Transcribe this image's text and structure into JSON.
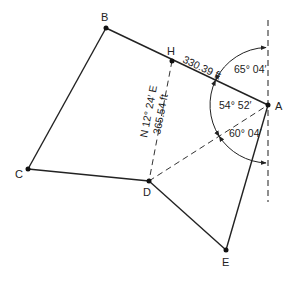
{
  "diagram": {
    "points": {
      "A": {
        "label": "A",
        "x": 268,
        "y": 105
      },
      "B": {
        "label": "B",
        "x": 106,
        "y": 28
      },
      "C": {
        "label": "C",
        "x": 28,
        "y": 169
      },
      "D": {
        "label": "D",
        "x": 149,
        "y": 181
      },
      "E": {
        "label": "E",
        "x": 226,
        "y": 250
      },
      "H": {
        "label": "H",
        "x": 172,
        "y": 61
      }
    },
    "solid_lines": [
      [
        "A",
        "B"
      ],
      [
        "B",
        "C"
      ],
      [
        "C",
        "D"
      ],
      [
        "D",
        "E"
      ],
      [
        "E",
        "A"
      ]
    ],
    "dashed_lines": [
      [
        "H",
        "D"
      ],
      [
        "D",
        "A"
      ]
    ],
    "meridian": {
      "x": 268,
      "y1": 20,
      "y2": 202,
      "style": "dashed"
    },
    "labels": {
      "distance_AH": "330.39 ft",
      "bearing_HD": "N 12° 24′ E",
      "distance_HD": "365.54 ft",
      "angle_north": "65° 04′",
      "angle_HAD": "54° 52′",
      "angle_south": "60° 04′"
    },
    "colors": {
      "line": "#222222",
      "background": "#ffffff"
    }
  }
}
